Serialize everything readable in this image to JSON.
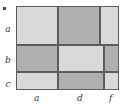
{
  "figure": {
    "type": "mosaic-plot",
    "corner_mark": "•"
  },
  "axes": {
    "y_labels": [
      "a",
      "b",
      "c"
    ],
    "x_labels": [
      "a",
      "d",
      "f"
    ]
  },
  "colors": {
    "light_cell": "#d9d9d9",
    "dark_cell": "#b0b0b0",
    "border": "#5c5c5c",
    "text": "#3a3a3a",
    "background": "#ffffff"
  },
  "chart_data": {
    "type": "heatmap",
    "title": "",
    "xlabel": "",
    "ylabel": "",
    "x_categories": [
      "a",
      "d",
      "f"
    ],
    "y_categories": [
      "a",
      "b",
      "c"
    ],
    "legend": [],
    "grid": true,
    "note": "Mosaic plot: row heights and column widths vary by row; cells alternate light and dark shading in a checkerboard pattern.",
    "rows": [
      {
        "label": "a",
        "height_pct": 47.0,
        "top_pct": 0.0,
        "cells": [
          {
            "x": "a",
            "shade": "light",
            "width_pct": 40.5,
            "left_pct": 0.0,
            "value": 0.405
          },
          {
            "x": "d",
            "shade": "dark",
            "width_pct": 41.5,
            "left_pct": 40.5,
            "value": 0.415
          },
          {
            "x": "f",
            "shade": "light",
            "width_pct": 18.0,
            "left_pct": 82.0,
            "value": 0.18
          }
        ]
      },
      {
        "label": "b",
        "height_pct": 32.0,
        "top_pct": 47.0,
        "cells": [
          {
            "x": "a",
            "shade": "dark",
            "width_pct": 40.5,
            "left_pct": 0.0,
            "value": 0.405
          },
          {
            "x": "d",
            "shade": "light",
            "width_pct": 44.5,
            "left_pct": 40.5,
            "value": 0.445
          },
          {
            "x": "f",
            "shade": "dark",
            "width_pct": 15.0,
            "left_pct": 85.0,
            "value": 0.15
          }
        ]
      },
      {
        "label": "c",
        "height_pct": 21.0,
        "top_pct": 79.0,
        "cells": [
          {
            "x": "a",
            "shade": "light",
            "width_pct": 40.5,
            "left_pct": 0.0,
            "value": 0.405
          },
          {
            "x": "d",
            "shade": "dark",
            "width_pct": 44.5,
            "left_pct": 40.5,
            "value": 0.445
          },
          {
            "x": "f",
            "shade": "light",
            "width_pct": 15.0,
            "left_pct": 85.0,
            "value": 0.15
          }
        ]
      }
    ],
    "y_label_positions_pct": [
      23,
      60,
      88
    ],
    "x_label_positions_pct": [
      20,
      62,
      92
    ]
  }
}
